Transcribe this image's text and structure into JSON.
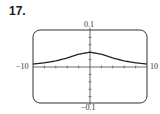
{
  "problem_number": "17.",
  "chart_data": {
    "type": "line",
    "title": "",
    "xlabel": "",
    "ylabel": "",
    "xlim": [
      -10,
      10
    ],
    "ylim": [
      -0.1,
      0.1
    ],
    "x_tick_step": 2,
    "y_tick_step": 0.02,
    "axis_labels": {
      "x_min": "−10",
      "x_max": "10",
      "y_max": "0.1",
      "y_min": "−0.1"
    },
    "grid": false,
    "legend": null,
    "series": [
      {
        "name": "curve",
        "x": [
          -10,
          -8,
          -6,
          -4,
          -2,
          0,
          2,
          4,
          6,
          8,
          10
        ],
        "y": [
          0.008,
          0.0112,
          0.0164,
          0.0244,
          0.0345,
          0.04,
          0.0345,
          0.0244,
          0.0164,
          0.0112,
          0.008
        ]
      }
    ]
  }
}
